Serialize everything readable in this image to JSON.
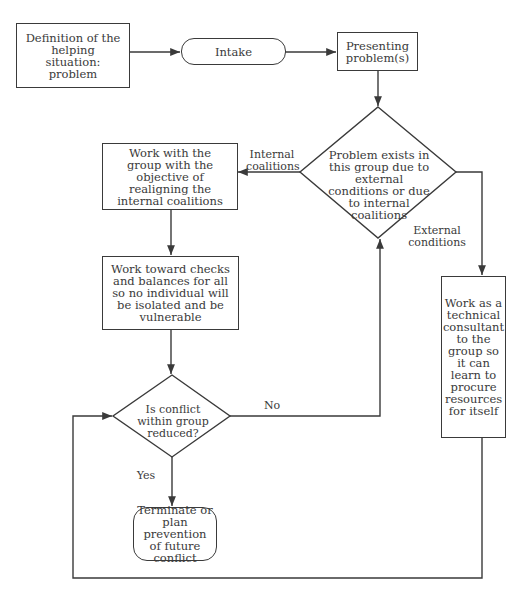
{
  "diagram": {
    "type": "flowchart",
    "nodes": {
      "definition": {
        "shape": "rectangle",
        "label": "Definition of the helping situation: problem"
      },
      "intake": {
        "shape": "terminal",
        "label": "Intake"
      },
      "presenting": {
        "shape": "rectangle",
        "label": "Presenting problem(s)"
      },
      "decision_cause": {
        "shape": "diamond",
        "label": "Problem exists in this group due to external conditions or due to internal coalitions"
      },
      "realign": {
        "shape": "rectangle",
        "label": "Work with the group with the objective of realigning the internal coalitions"
      },
      "checks": {
        "shape": "rectangle",
        "label": "Work toward checks and balances for all so no individual will be isolated and be vulnerable"
      },
      "decision_reduced": {
        "shape": "diamond",
        "label": "Is conflict within group reduced?"
      },
      "terminate": {
        "shape": "terminal",
        "label": "Terminate or plan prevention of future conflict"
      },
      "consultant": {
        "shape": "rectangle",
        "label": "Work as a technical consultant to the group so it can learn to procure resources for itself"
      }
    },
    "edge_labels": {
      "internal": "Internal coalitions",
      "external": "External conditions",
      "no": "No",
      "yes": "Yes"
    },
    "edges": [
      {
        "from": "definition",
        "to": "intake"
      },
      {
        "from": "intake",
        "to": "presenting"
      },
      {
        "from": "presenting",
        "to": "decision_cause"
      },
      {
        "from": "decision_cause",
        "to": "realign",
        "label": "Internal coalitions"
      },
      {
        "from": "decision_cause",
        "to": "consultant",
        "label": "External conditions"
      },
      {
        "from": "realign",
        "to": "checks"
      },
      {
        "from": "checks",
        "to": "decision_reduced"
      },
      {
        "from": "decision_reduced",
        "to": "decision_cause",
        "label": "No"
      },
      {
        "from": "decision_reduced",
        "to": "terminate",
        "label": "Yes"
      },
      {
        "from": "consultant",
        "to": "decision_reduced"
      }
    ]
  },
  "colors": {
    "line": "#3a3a3a",
    "background": "#ffffff"
  }
}
